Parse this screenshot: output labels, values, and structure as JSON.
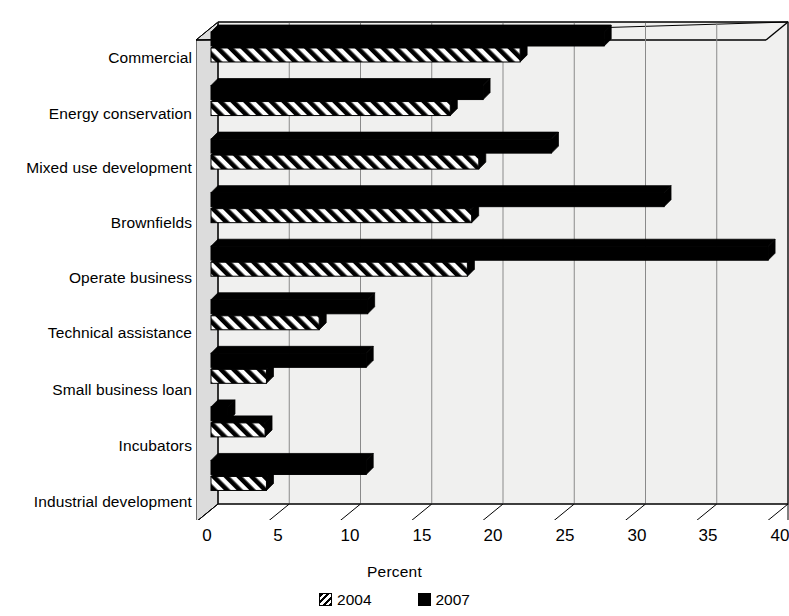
{
  "chart_data": {
    "type": "bar",
    "orientation": "horizontal",
    "title": "",
    "subtitle": "",
    "xlabel": "Percent",
    "ylabel": "",
    "xlim": [
      0,
      40
    ],
    "xticks": [
      0,
      5,
      10,
      15,
      20,
      25,
      30,
      35,
      40
    ],
    "grid": true,
    "legend_position": "bottom",
    "categories": [
      "Commercial",
      "Energy conservation",
      "Mixed use development",
      "Brownfields",
      "Operate business",
      "Technical assistance",
      "Small business loan",
      "Incubators",
      "Industrial development"
    ],
    "series": [
      {
        "name": "2004",
        "color": "#000000",
        "pattern": "diagonal-hatch",
        "values": [
          21.2,
          16.3,
          18.3,
          17.8,
          17.5,
          7.1,
          3.4,
          3.3,
          3.4
        ]
      },
      {
        "name": "2007",
        "color": "#000000",
        "pattern": "solid",
        "values": [
          27.1,
          18.6,
          23.4,
          31.3,
          38.6,
          10.5,
          10.4,
          0.7,
          10.4
        ]
      }
    ]
  },
  "axis": {
    "x_title": "Percent",
    "tick_labels": [
      "0",
      "5",
      "10",
      "15",
      "20",
      "25",
      "30",
      "35",
      "40"
    ]
  },
  "legend": {
    "items": [
      {
        "label": "2004",
        "swatch": "hatched-square-icon"
      },
      {
        "label": "2007",
        "swatch": "solid-square-icon"
      }
    ]
  },
  "colors": {
    "bar_fill": "#000000",
    "plot_background": "#f0f0ef",
    "gridline": "#8a8a8a",
    "axis_line": "#000000",
    "page_background": "#ffffff"
  }
}
